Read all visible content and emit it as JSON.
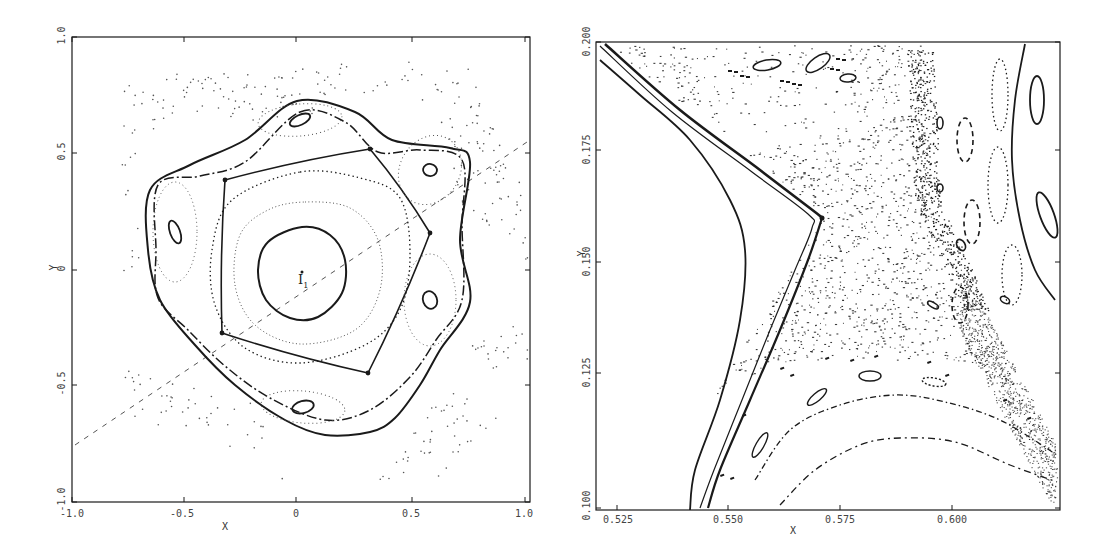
{
  "chart_data": [
    {
      "type": "scatter",
      "title": "",
      "subtitle": "Surface of section — full view",
      "xlabel": "X",
      "ylabel": "Y",
      "xlim": [
        -1.0,
        1.0
      ],
      "ylim": [
        -1.0,
        1.0
      ],
      "x_ticks": [
        "-1.0",
        "-0.5",
        "0",
        "0.5",
        "1.0"
      ],
      "y_ticks": [
        "-1.0",
        "-0.5",
        "0",
        "0.5",
        "1.0"
      ],
      "grid": false,
      "legend": null,
      "annotations": [
        {
          "text": "I",
          "sub": "1",
          "x": 0.03,
          "y": -0.05
        }
      ],
      "series": [
        {
          "name": "central invariant curve (I1)",
          "style": "solid",
          "center": [
            0.02,
            0.0
          ],
          "radius": 0.28
        },
        {
          "name": "inner dotted invariant curve",
          "style": "dotted",
          "radius": 0.45
        },
        {
          "name": "outer dotted invariant curve",
          "style": "dotted",
          "radius": 0.62
        },
        {
          "name": "separatrix / 5-island chain boundary",
          "style": "dash-dot"
        },
        {
          "name": "outer bounding curve",
          "style": "solid"
        },
        {
          "name": "5-island chain centers",
          "style": "solid-ellipse",
          "points": [
            [
              0.02,
              0.6
            ],
            [
              0.56,
              0.44
            ],
            [
              0.55,
              -0.14
            ],
            [
              0.02,
              -0.52
            ],
            [
              -0.52,
              0.16
            ]
          ]
        },
        {
          "name": "hyperbolic (X) points",
          "style": "marker",
          "points": [
            [
              -0.32,
              0.4
            ],
            [
              0.3,
              0.56
            ],
            [
              0.62,
              0.13
            ],
            [
              0.32,
              -0.45
            ],
            [
              -0.36,
              -0.33
            ]
          ]
        },
        {
          "name": "symmetry line",
          "style": "dashed",
          "x": [
            -1.0,
            1.0
          ],
          "y": [
            -0.76,
            0.56
          ]
        },
        {
          "name": "chaotic outer scatter",
          "style": "dots"
        }
      ]
    },
    {
      "type": "scatter",
      "title": "",
      "subtitle": "Surface of section — magnified region near hyperbolic point",
      "xlabel": "X",
      "ylabel": "Y",
      "xlim": [
        0.519,
        0.6235
      ],
      "ylim": [
        0.1,
        0.2
      ],
      "x_ticks": [
        "0.525",
        "0.550",
        "0.575",
        "0.600"
      ],
      "y_ticks": [
        "0.100",
        "0.125",
        "0.150",
        "0.175",
        "0.200"
      ],
      "grid": false,
      "legend": null,
      "annotations": [],
      "series": [
        {
          "name": "inner invariant curve",
          "style": "solid"
        },
        {
          "name": "separatrix (double line)",
          "style": "solid"
        },
        {
          "name": "hyperbolic point",
          "style": "marker",
          "points": [
            [
              0.5695,
              0.161
            ]
          ]
        },
        {
          "name": "chaotic sea",
          "style": "dots"
        },
        {
          "name": "outer invariant curve (right)",
          "style": "solid"
        },
        {
          "name": "lower dash-dot curves",
          "style": "dash-dot"
        },
        {
          "name": "higher-order island chains",
          "style": "ellipses/dashes"
        }
      ]
    }
  ],
  "left": {
    "x_axis_label": "X",
    "y_axis_label": "Y",
    "x_ticks": [
      {
        "label": "-1.0",
        "px": 72
      },
      {
        "label": "-0.5",
        "px": 184
      },
      {
        "label": "0",
        "px": 296
      },
      {
        "label": "0.5",
        "px": 412
      },
      {
        "label": "1.0",
        "px": 525
      }
    ],
    "y_ticks": [
      {
        "label": "1.0",
        "px": 37
      },
      {
        "label": "0.5",
        "px": 153
      },
      {
        "label": "0",
        "px": 270
      },
      {
        "label": "-0.5",
        "px": 385
      },
      {
        "label": "-1.0",
        "px": 502
      }
    ],
    "annotation": {
      "main": "I",
      "sub": "1"
    }
  },
  "right": {
    "x_axis_label": "X",
    "y_axis_label": "Y",
    "x_ticks": [
      {
        "label": "0.525",
        "px": 617
      },
      {
        "label": "0.550",
        "px": 728
      },
      {
        "label": "0.575",
        "px": 840
      },
      {
        "label": "0.600",
        "px": 952
      }
    ],
    "y_ticks": [
      {
        "label": "0.200",
        "px": 42
      },
      {
        "label": "0.175",
        "px": 150
      },
      {
        "label": "0.150",
        "px": 262
      },
      {
        "label": "0.125",
        "px": 373
      },
      {
        "label": "0.100",
        "px": 508
      }
    ]
  },
  "colors": {
    "ink": "#1a1a1a",
    "light_ink": "#555555",
    "background": "#ffffff"
  }
}
